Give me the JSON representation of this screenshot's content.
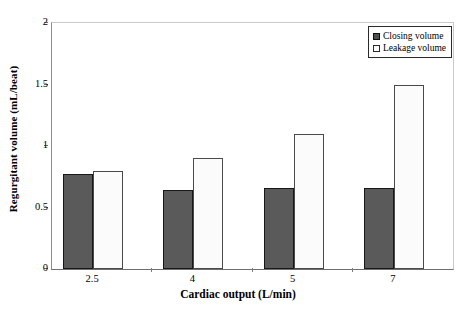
{
  "chart_data": {
    "type": "bar",
    "title": "",
    "xlabel": "Cardiac output (L/min)",
    "ylabel": "Regurgitant volume (mL/beat)",
    "categories": [
      "2.5",
      "4",
      "5",
      "7"
    ],
    "series": [
      {
        "name": "Closing volume",
        "values": [
          0.77,
          0.64,
          0.66,
          0.66
        ],
        "color": "#5a5a5a"
      },
      {
        "name": "Leakage volume",
        "values": [
          0.8,
          0.9,
          1.1,
          1.5
        ],
        "color": "#fbfbfb"
      }
    ],
    "ylim": [
      0,
      2
    ],
    "yticks": [
      "0",
      "0.5",
      "1",
      "1.5",
      "2"
    ],
    "ytick_values": [
      0,
      0.5,
      1,
      1.5,
      2
    ],
    "grid": false,
    "legend_position": "top-right"
  },
  "legend": {
    "items": [
      {
        "label": "Closing volume",
        "swatch": "filled-dark-square"
      },
      {
        "label": "Leakage volume",
        "swatch": "empty-white-square"
      }
    ]
  }
}
